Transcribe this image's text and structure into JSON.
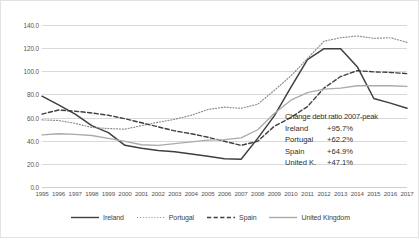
{
  "chart_data": {
    "type": "line",
    "title": "",
    "xlabel": "",
    "ylabel": "",
    "ylim": [
      0,
      140
    ],
    "ytick_step": 20,
    "grid": true,
    "legend_position": "bottom",
    "x": [
      1995,
      1996,
      1997,
      1998,
      1999,
      2000,
      2001,
      2002,
      2003,
      2004,
      2005,
      2006,
      2007,
      2008,
      2009,
      2010,
      2011,
      2012,
      2013,
      2014,
      2015,
      2016,
      2017
    ],
    "ytick_labels": [
      "0.0",
      "20.0",
      "40.0",
      "60.0",
      "80.0",
      "100.0",
      "120.0",
      "140.0"
    ],
    "xtick_labels": [
      "1995",
      "1996",
      "1997",
      "1998",
      "1999",
      "2000",
      "2001",
      "2002",
      "2003",
      "2004",
      "2005",
      "2006",
      "2007",
      "2008",
      "2009",
      "2010",
      "2011",
      "2012",
      "2013",
      "2014",
      "2015",
      "2016",
      "2017"
    ],
    "series": [
      {
        "name": "Ireland",
        "style": "solid",
        "color": "#3f3f3f",
        "width": 1.5,
        "values": [
          78.5,
          71.0,
          63.0,
          53.0,
          47.0,
          36.0,
          33.5,
          31.5,
          30.5,
          28.5,
          26.5,
          24.5,
          24.0,
          42.0,
          61.5,
          86.0,
          110.0,
          119.5,
          119.5,
          104.0,
          76.5,
          72.5,
          68.0
        ]
      },
      {
        "name": "Portugal",
        "style": "dotted",
        "color": "#8c8c8c",
        "width": 1.2,
        "values": [
          58.0,
          57.5,
          55.0,
          51.5,
          50.5,
          50.0,
          53.0,
          56.0,
          58.5,
          62.0,
          67.0,
          69.0,
          68.0,
          71.5,
          83.5,
          96.0,
          111.0,
          126.0,
          129.0,
          130.5,
          128.5,
          129.0,
          125.0
        ]
      },
      {
        "name": "Spain",
        "style": "dashed",
        "color": "#3f3f3f",
        "width": 1.4,
        "values": [
          63.0,
          66.5,
          65.5,
          64.0,
          62.0,
          59.0,
          55.5,
          52.0,
          48.5,
          46.0,
          43.0,
          39.5,
          36.0,
          39.5,
          52.5,
          60.0,
          69.5,
          85.5,
          95.5,
          100.5,
          99.5,
          99.0,
          98.0
        ]
      },
      {
        "name": "United Kingdom",
        "style": "solid-light",
        "color": "#aaaaaa",
        "width": 1.3,
        "values": [
          45.0,
          46.0,
          45.5,
          44.5,
          42.0,
          39.5,
          36.5,
          36.0,
          37.5,
          39.0,
          40.5,
          41.0,
          42.5,
          49.5,
          63.5,
          75.0,
          81.5,
          84.5,
          85.5,
          87.5,
          87.5,
          87.5,
          87.0
        ]
      }
    ],
    "annotation": {
      "title": "Change debt ratio 2007-peak",
      "rows": [
        {
          "name": "Ireland",
          "value": "+95.7%"
        },
        {
          "name": "Portugal",
          "value": "+62.2%"
        },
        {
          "name": "Spain",
          "value": "+64.9%"
        },
        {
          "name": "United K.",
          "value": "+47.1%"
        }
      ]
    },
    "legend": [
      {
        "label": "Ireland",
        "style": "solid",
        "color": "#3f3f3f"
      },
      {
        "label": "Portugal",
        "style": "dotted",
        "color": "#8c8c8c"
      },
      {
        "label": "Spain",
        "style": "dashed",
        "color": "#3f3f3f"
      },
      {
        "label": "United Kingdom",
        "style": "solid-light",
        "color": "#aaaaaa"
      }
    ]
  }
}
